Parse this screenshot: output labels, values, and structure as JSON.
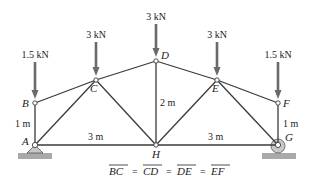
{
  "diagram": {
    "type": "truss",
    "nodes": {
      "A": {
        "label": "A",
        "x": 35,
        "y": 145
      },
      "B": {
        "label": "B",
        "x": 35,
        "y": 103
      },
      "C": {
        "label": "C",
        "x": 96,
        "y": 80
      },
      "D": {
        "label": "D",
        "x": 156,
        "y": 61
      },
      "E": {
        "label": "E",
        "x": 217,
        "y": 80
      },
      "F": {
        "label": "F",
        "x": 278,
        "y": 103
      },
      "G": {
        "label": "G",
        "x": 278,
        "y": 145
      },
      "H": {
        "label": "H",
        "x": 156,
        "y": 145
      }
    },
    "members": [
      [
        "A",
        "B"
      ],
      [
        "B",
        "C"
      ],
      [
        "C",
        "D"
      ],
      [
        "D",
        "E"
      ],
      [
        "E",
        "F"
      ],
      [
        "F",
        "G"
      ],
      [
        "A",
        "H"
      ],
      [
        "H",
        "G"
      ],
      [
        "A",
        "C"
      ],
      [
        "C",
        "H"
      ],
      [
        "D",
        "H"
      ],
      [
        "H",
        "E"
      ],
      [
        "E",
        "G"
      ]
    ],
    "loads": [
      {
        "node": "B",
        "label": "1.5 kN"
      },
      {
        "node": "C",
        "label": "3 kN"
      },
      {
        "node": "D",
        "label": "3 kN"
      },
      {
        "node": "E",
        "label": "3 kN"
      },
      {
        "node": "F",
        "label": "1.5 kN"
      }
    ],
    "dimensions": {
      "ab": "1 m",
      "fg": "1 m",
      "dh": "2 m",
      "ah": "3 m",
      "hg": "3 m"
    },
    "supports": {
      "A": "pin",
      "G": "roller"
    },
    "caption": {
      "segments": [
        "BC",
        "CD",
        "DE",
        "EF"
      ],
      "equals": "="
    }
  }
}
